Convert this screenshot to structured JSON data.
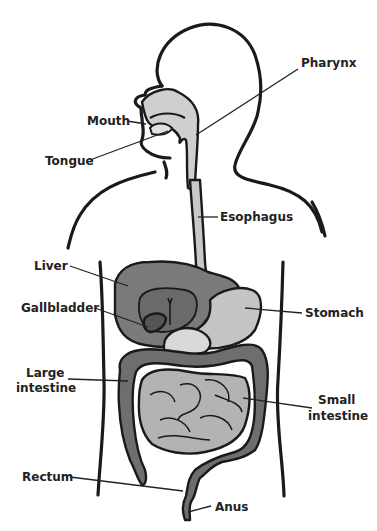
{
  "figure": {
    "colors": {
      "background": "#ffffff",
      "outline": "#1a1a1a",
      "pharynx_fill": "#cfcfcf",
      "esophagus_fill": "#c8c8c8",
      "liver_fill": "#7a7a7a",
      "liver_inner_fill": "#6a6a6a",
      "gallbladder_fill": "#555555",
      "stomach_fill": "#c4c4c4",
      "large_intestine_fill": "#6e6e6e",
      "small_intestine_fill": "#b3b3b3",
      "pancreas_fill": "#d9d9d9",
      "label_color": "#222222"
    },
    "labels": {
      "pharynx": "Pharynx",
      "mouth": "Mouth",
      "tongue": "Tongue",
      "esophagus": "Esophagus",
      "liver": "Liver",
      "gallbladder": "Gallbladder",
      "stomach": "Stomach",
      "large_intestine_line1": "Large",
      "large_intestine_line2": "intestine",
      "small_intestine_line1": "Small",
      "small_intestine_line2": "intestine",
      "rectum": "Rectum",
      "anus": "Anus"
    }
  }
}
